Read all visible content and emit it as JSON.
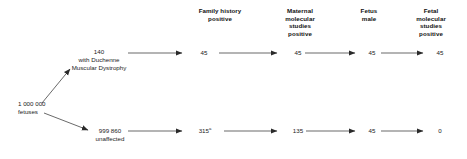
{
  "diagram": {
    "type": "flow-diagram",
    "title": "",
    "columns": [
      {
        "id": "family-history",
        "label": "Family history\npositive"
      },
      {
        "id": "maternal-molecular",
        "label": "Maternal\nmolecular\nstudies\npositive"
      },
      {
        "id": "fetus-male",
        "label": "Fetus\nmale"
      },
      {
        "id": "fetal-molecular",
        "label": "Fetal\nmolecular\nstudies\npositive"
      }
    ],
    "root": {
      "count": "1 000 000",
      "label": "fetuses",
      "text": "1 000 000\nfetuses"
    },
    "branches": [
      {
        "id": "affected",
        "start": {
          "count": "140",
          "label": "with Duchenne\nMuscular Dystrophy",
          "text": "140\nwith Duchenne\nMuscular Dystrophy"
        },
        "values": [
          "45",
          "45",
          "45",
          "45"
        ],
        "footnote_marks": [
          "",
          "",
          "",
          ""
        ]
      },
      {
        "id": "unaffected",
        "start": {
          "count": "999 860",
          "label": "unaffected",
          "text": "999 860\nunaffected"
        },
        "values": [
          "315",
          "135",
          "45",
          "0"
        ],
        "footnote_marks": [
          "a",
          "",
          "",
          ""
        ]
      }
    ],
    "colors": {
      "stroke": "#2a2a2a",
      "text": "#1a1a1a",
      "header_text": "#111111",
      "background": "#ffffff"
    }
  }
}
